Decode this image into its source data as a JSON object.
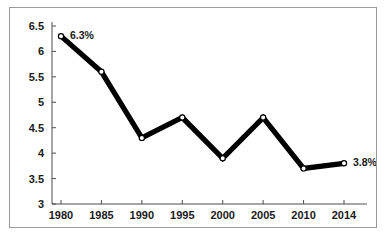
{
  "chart_data": {
    "type": "line",
    "title": "",
    "subtitle": "",
    "xlabel": "",
    "ylabel": "",
    "categories": [
      "1980",
      "1985",
      "1990",
      "1995",
      "2000",
      "2005",
      "2010",
      "2014"
    ],
    "values": [
      6.3,
      5.6,
      4.3,
      4.7,
      3.9,
      4.7,
      3.7,
      3.8
    ],
    "series": [
      {
        "name": "rate",
        "values": [
          6.3,
          5.6,
          4.3,
          4.7,
          3.9,
          4.7,
          3.7,
          3.8
        ]
      }
    ],
    "ylim": [
      3,
      6.5
    ],
    "ytick_labels": [
      "3",
      "3.5",
      "4",
      "4.5",
      "5",
      "5.5",
      "6",
      "6.5"
    ],
    "ytick_values": [
      3,
      3.5,
      4,
      4.5,
      5,
      5.5,
      6,
      6.5
    ],
    "xtick_labels": [
      "1980",
      "1985",
      "1990",
      "1995",
      "2000",
      "2005",
      "2010",
      "2014"
    ],
    "grid": false,
    "legend": false,
    "legend_position": "none",
    "marker": "open-circle",
    "line_color": "#000000",
    "marker_fill": "#ffffff",
    "annotations": [
      {
        "text": "6.3%",
        "category": "1980",
        "value": 6.3,
        "position": "right"
      },
      {
        "text": "3.8%",
        "category": "2014",
        "value": 3.8,
        "position": "right"
      }
    ]
  },
  "frame": {
    "border_color": "#9a9a9a",
    "background": "#ffffff"
  }
}
